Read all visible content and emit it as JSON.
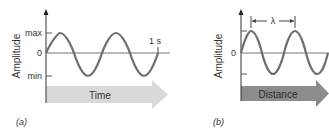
{
  "panel_a": {
    "caption": "(a)",
    "y_axis_label": "Amplitude",
    "y_ticks": [
      "max",
      "0",
      "min"
    ],
    "time_marker": "1 s",
    "arrow_label": "Time",
    "arrow_color": "#d9d9d9",
    "wave_color": "#6e6e6e",
    "cycles": 2
  },
  "panel_b": {
    "caption": "(b)",
    "y_axis_label": "Amplitude",
    "y_ticks": [
      "0"
    ],
    "wavelength_label": "λ",
    "arrow_label": "Distance",
    "arrow_color": "#8c8c8c",
    "wave_color": "#6e6e6e",
    "cycles": 2
  }
}
